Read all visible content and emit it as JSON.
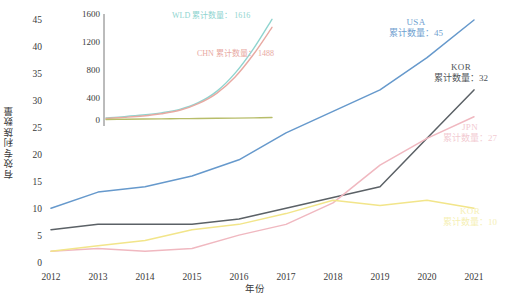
{
  "chart_data": {
    "type": "line",
    "title": "",
    "xlabel": "年份",
    "ylabel": "有效专利族数量",
    "x": [
      2012,
      2013,
      2014,
      2015,
      2016,
      2017,
      2018,
      2019,
      2020,
      2021
    ],
    "xlim": [
      2012,
      2021
    ],
    "ylim": [
      0,
      46
    ],
    "yticks": [
      0,
      5,
      10,
      15,
      20,
      25,
      30,
      35,
      40,
      45
    ],
    "grid": false,
    "legend_position": "inline-annotations",
    "series": [
      {
        "name": "USA",
        "color": "#6699cc",
        "cumulative": 45,
        "values": [
          10,
          13,
          14,
          16,
          19,
          24,
          28,
          32,
          38,
          45
        ]
      },
      {
        "name": "KOR",
        "color": "#5b6166",
        "cumulative": 32,
        "values": [
          6,
          7,
          7,
          7,
          8,
          10,
          12,
          14,
          23,
          32
        ]
      },
      {
        "name": "JPN",
        "color": "#f0b8c0",
        "cumulative": 27,
        "values": [
          2,
          2.5,
          2,
          2.5,
          5,
          7,
          11,
          18,
          23,
          27
        ]
      },
      {
        "name": "DEU",
        "color": "#f2e58a",
        "cumulative": 10,
        "values": [
          2,
          3,
          4,
          6,
          7,
          9,
          11.5,
          10.5,
          11.5,
          10
        ]
      }
    ]
  },
  "inset_chart": {
    "type": "line",
    "ylim": [
      0,
      1700
    ],
    "yticks": [
      0,
      400,
      800,
      1200,
      1600
    ],
    "x": [
      2012,
      2013,
      2014,
      2015,
      2016,
      2017,
      2018,
      2019,
      2020,
      2021
    ],
    "grid": false,
    "series": [
      {
        "name": "WLD",
        "color": "#8fd4cf",
        "cumulative": 1616,
        "values": [
          50,
          70,
          95,
          130,
          185,
          290,
          470,
          760,
          1150,
          1616
        ]
      },
      {
        "name": "CHN",
        "color": "#e8a9a2",
        "cumulative": 1488,
        "values": [
          40,
          58,
          80,
          115,
          170,
          275,
          440,
          700,
          1060,
          1488
        ]
      },
      {
        "name": "OTH",
        "color": "#b7bd6a",
        "cumulative": 55,
        "values": [
          25,
          28,
          31,
          34,
          37,
          40,
          43,
          46,
          50,
          55
        ]
      }
    ],
    "annotations": [
      {
        "label": "WLD",
        "value_label": "累计数量：",
        "value": "1616",
        "color": "#8fd4cf"
      },
      {
        "label": "CHN",
        "value_label": "累计数量：",
        "value": "1488",
        "color": "#e8a9a2"
      }
    ]
  },
  "axes": {
    "ytick_0": "0",
    "ytick_5": "5",
    "ytick_10": "10",
    "ytick_15": "15",
    "ytick_20": "20",
    "ytick_25": "25",
    "ytick_30": "30",
    "ytick_35": "35",
    "ytick_40": "40",
    "ytick_45": "45",
    "xtick_0": "2012",
    "xtick_1": "2013",
    "xtick_2": "2014",
    "xtick_3": "2015",
    "xtick_4": "2016",
    "xtick_5": "2017",
    "xtick_6": "2018",
    "xtick_7": "2019",
    "xtick_8": "2020",
    "xtick_9": "2021",
    "ylabel": "有效专利族数量",
    "xlabel": "年份"
  },
  "inset_axes": {
    "ytick_0": "0",
    "ytick_400": "400",
    "ytick_800": "800",
    "ytick_1200": "1200",
    "ytick_1600": "1600"
  },
  "annotations": {
    "usa_name": "USA",
    "usa_value": "累计数量：45",
    "kor_name": "KOR",
    "kor_value": "累计数量：32",
    "jpn_name": "JPN",
    "jpn_value": "累计数量：27",
    "deu_name": "KOR",
    "deu_value": "累计数量：10",
    "wld_name": "WLD",
    "wld_value": "累计数量：",
    "wld_num": "1616",
    "chn_name": "CHN",
    "chn_value": "累计数量：",
    "chn_num": "1488"
  }
}
